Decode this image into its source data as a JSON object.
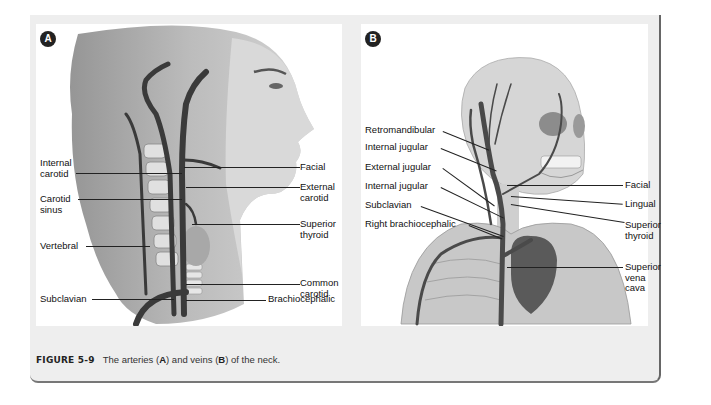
{
  "figure": {
    "number": "FIGURE 5-9",
    "caption_parts": [
      "The arteries (",
      "A",
      ") and veins (",
      "B",
      ") of the neck."
    ]
  },
  "panel_a": {
    "badge": "A",
    "subject": "arteries of the neck",
    "labels_left": [
      {
        "text": "Internal\ncarotid",
        "line1": "Internal",
        "line2": "carotid"
      },
      {
        "text": "Carotid\nsinus",
        "line1": "Carotid",
        "line2": "sinus"
      },
      {
        "text": "Vertebral",
        "line1": "Vertebral"
      },
      {
        "text": "Subclavian",
        "line1": "Subclavian"
      }
    ],
    "labels_right": [
      {
        "text": "Facial",
        "line1": "Facial"
      },
      {
        "text": "External\ncarotid",
        "line1": "External",
        "line2": "carotid"
      },
      {
        "text": "Superior\nthyroid",
        "line1": "Superior",
        "line2": "thyroid"
      },
      {
        "text": "Common\ncarotid",
        "line1": "Common",
        "line2": "carotid"
      },
      {
        "text": "Brachiocephalic",
        "line1": "Brachiocephalic"
      }
    ]
  },
  "panel_b": {
    "badge": "B",
    "subject": "veins of the neck",
    "labels_left": [
      {
        "line1": "Retromandibular"
      },
      {
        "line1": "Internal jugular"
      },
      {
        "line1": "External jugular"
      },
      {
        "line1": "Internal jugular"
      },
      {
        "line1": "Subclavian"
      },
      {
        "line1": "Right brachiocephalic"
      }
    ],
    "labels_right": [
      {
        "line1": "Facial"
      },
      {
        "line1": "Lingual"
      },
      {
        "line1": "Superior",
        "line2": "thyroid"
      },
      {
        "line1": "Superior",
        "line2": "vena",
        "line3": "cava"
      }
    ]
  },
  "colors": {
    "frame_bg": "#eeeeee",
    "panel_bg": "#ffffff",
    "badge_bg": "#222222",
    "text": "#111111",
    "caption_text": "#333333"
  }
}
